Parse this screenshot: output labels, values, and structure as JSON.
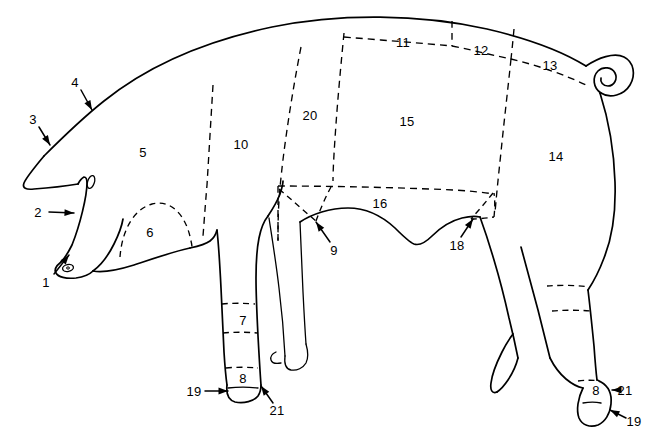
{
  "figure": {
    "view": "left lateral profile",
    "line_color": "#000000",
    "background_color": "#ffffff",
    "cut_line_style": "dashed",
    "outline_style": "solid"
  },
  "region_labels": [
    {
      "id": "r5",
      "text": "5",
      "x": 143,
      "y": 152
    },
    {
      "id": "r6",
      "text": "6",
      "x": 150,
      "y": 232
    },
    {
      "id": "r7",
      "text": "7",
      "x": 243,
      "y": 320
    },
    {
      "id": "r8f",
      "text": "8",
      "x": 243,
      "y": 378
    },
    {
      "id": "r10",
      "text": "10",
      "x": 241,
      "y": 144
    },
    {
      "id": "r11",
      "text": "11",
      "x": 403,
      "y": 42
    },
    {
      "id": "r12",
      "text": "12",
      "x": 481,
      "y": 50
    },
    {
      "id": "r13",
      "text": "13",
      "x": 550,
      "y": 65
    },
    {
      "id": "r14",
      "text": "14",
      "x": 556,
      "y": 156
    },
    {
      "id": "r15",
      "text": "15",
      "x": 407,
      "y": 121
    },
    {
      "id": "r16",
      "text": "16",
      "x": 380,
      "y": 203
    },
    {
      "id": "r20",
      "text": "20",
      "x": 310,
      "y": 115
    },
    {
      "id": "r8h",
      "text": "8",
      "x": 596,
      "y": 390
    }
  ],
  "callouts": [
    {
      "id": "c1",
      "text": "1",
      "label_x": 46,
      "label_y": 282,
      "tail_x": 54,
      "tail_y": 274,
      "tip_x": 69,
      "tip_y": 255
    },
    {
      "id": "c2",
      "text": "2",
      "label_x": 38,
      "label_y": 212,
      "tail_x": 49,
      "tail_y": 212,
      "tip_x": 74,
      "tip_y": 213
    },
    {
      "id": "c3",
      "text": "3",
      "label_x": 33,
      "label_y": 119,
      "tail_x": 39,
      "tail_y": 127,
      "tip_x": 50,
      "tip_y": 145
    },
    {
      "id": "c4",
      "text": "4",
      "label_x": 75,
      "label_y": 82,
      "tail_x": 81,
      "tail_y": 90,
      "tip_x": 92,
      "tip_y": 110
    },
    {
      "id": "c9",
      "text": "9",
      "label_x": 334,
      "label_y": 250,
      "tail_x": 330,
      "tail_y": 242,
      "tip_x": 316,
      "tip_y": 222
    },
    {
      "id": "c18",
      "text": "18",
      "label_x": 457,
      "label_y": 245,
      "tail_x": 461,
      "tail_y": 237,
      "tip_x": 473,
      "tip_y": 219
    },
    {
      "id": "c19f",
      "text": "19",
      "label_x": 194,
      "label_y": 391,
      "tail_x": 205,
      "tail_y": 391,
      "tip_x": 228,
      "tip_y": 391
    },
    {
      "id": "c21f",
      "text": "21",
      "label_x": 277,
      "label_y": 410,
      "tail_x": 273,
      "tail_y": 403,
      "tip_x": 261,
      "tip_y": 386
    },
    {
      "id": "c21h",
      "text": "21",
      "label_x": 625,
      "label_y": 390,
      "tail_x": 618,
      "tail_y": 390,
      "tip_x": 612,
      "tip_y": 390
    },
    {
      "id": "c19h",
      "text": "19",
      "label_x": 634,
      "label_y": 421,
      "tail_x": 626,
      "tail_y": 418,
      "tip_x": 610,
      "tip_y": 410
    }
  ],
  "legend_numbers": [
    "1",
    "2",
    "3",
    "4",
    "5",
    "6",
    "7",
    "8",
    "9",
    "10",
    "11",
    "12",
    "13",
    "14",
    "15",
    "16",
    "18",
    "19",
    "20",
    "21"
  ]
}
